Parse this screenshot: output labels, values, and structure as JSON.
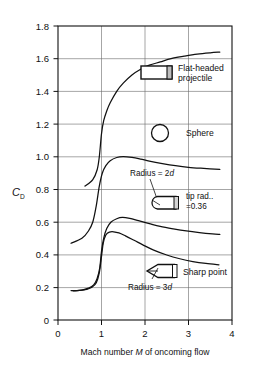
{
  "chart_data": {
    "type": "line",
    "title": "",
    "subtitle": "",
    "xlabel": "Mach number M of oncoming flow",
    "ylabel": "C_D",
    "ylabel_main": "C",
    "ylabel_sub": "D",
    "xlim": [
      0,
      4
    ],
    "ylim": [
      0,
      1.8
    ],
    "grid": true,
    "xticks": [
      "0",
      "1",
      "2",
      "3",
      "4"
    ],
    "xtick_values": [
      0,
      1,
      2,
      3,
      4
    ],
    "yticks": [
      "0",
      "0.2",
      "0.4",
      "0.6",
      "0.8",
      "1.0",
      "1.2",
      "1.4",
      "1.6",
      "1.8"
    ],
    "ytick_values": [
      0,
      0.2,
      0.4,
      0.6,
      0.8,
      1.0,
      1.2,
      1.4,
      1.6,
      1.8
    ],
    "legend_position": "inside-right",
    "series": [
      {
        "name": "Flat-headed projectile",
        "x": [
          0.62,
          0.8,
          0.9,
          0.95,
          1.0,
          1.05,
          1.12,
          1.2,
          1.35,
          1.5,
          1.7,
          1.9,
          2.1,
          2.35,
          2.6,
          2.9,
          3.2,
          3.5,
          3.72
        ],
        "y": [
          0.82,
          0.86,
          0.92,
          1.0,
          1.14,
          1.22,
          1.28,
          1.33,
          1.4,
          1.45,
          1.5,
          1.535,
          1.56,
          1.58,
          1.6,
          1.615,
          1.628,
          1.636,
          1.64
        ]
      },
      {
        "name": "Sphere",
        "x": [
          0.3,
          0.55,
          0.7,
          0.8,
          0.88,
          0.95,
          1.02,
          1.1,
          1.2,
          1.35,
          1.5,
          1.7,
          1.9,
          2.1,
          2.4,
          2.7,
          3.0,
          3.35,
          3.72
        ],
        "y": [
          0.47,
          0.5,
          0.545,
          0.6,
          0.7,
          0.82,
          0.9,
          0.945,
          0.975,
          0.995,
          1.0,
          0.995,
          0.985,
          0.973,
          0.958,
          0.945,
          0.935,
          0.928,
          0.922
        ]
      },
      {
        "name": "Radius = 2d",
        "x": [
          0.35,
          0.55,
          0.7,
          0.82,
          0.9,
          0.96,
          1.0,
          1.05,
          1.12,
          1.22,
          1.35,
          1.48,
          1.65,
          1.85,
          2.1,
          2.35,
          2.65,
          2.95,
          3.25,
          3.55,
          3.72
        ],
        "y": [
          0.178,
          0.183,
          0.195,
          0.215,
          0.255,
          0.32,
          0.42,
          0.5,
          0.56,
          0.6,
          0.62,
          0.628,
          0.622,
          0.608,
          0.59,
          0.573,
          0.558,
          0.545,
          0.535,
          0.527,
          0.524
        ]
      },
      {
        "name": "Radius = 3d",
        "x": [
          0.3,
          0.5,
          0.66,
          0.78,
          0.88,
          0.95,
          1.0,
          1.04,
          1.1,
          1.18,
          1.28,
          1.4,
          1.55,
          1.75,
          1.95,
          2.2,
          2.5,
          2.8,
          3.1,
          3.4,
          3.7
        ],
        "y": [
          0.18,
          0.182,
          0.188,
          0.2,
          0.228,
          0.29,
          0.39,
          0.47,
          0.52,
          0.538,
          0.54,
          0.533,
          0.515,
          0.488,
          0.46,
          0.428,
          0.398,
          0.375,
          0.358,
          0.346,
          0.338
        ]
      }
    ],
    "annotations": [
      {
        "id": "flat-headed",
        "text_line1": "Flat-headed",
        "text_line2": "projectile",
        "icon": "flat-nose-projectile-icon"
      },
      {
        "id": "sphere",
        "text": "Sphere",
        "icon": "sphere-icon"
      },
      {
        "id": "radius-2d",
        "text_prefix": "Radius = 2",
        "text_italic": "d"
      },
      {
        "id": "tip-radius",
        "text_line1": "tip rad..",
        "text_line2_prefix": "=0.36",
        "text_line2_italic": "d",
        "icon": "round-nose-projectile-icon"
      },
      {
        "id": "sharp-point",
        "text": "Sharp point",
        "icon": "sharp-nose-projectile-icon"
      },
      {
        "id": "radius-3d",
        "text_prefix": "Radius = 3",
        "text_italic": "d"
      }
    ],
    "xcaption_prefix": "Mach number ",
    "xcaption_italic": "M",
    "xcaption_suffix": " of oncoming flow",
    "colors": {
      "axis": "#111111",
      "grid": "#555555",
      "curve": "#111111",
      "background": "#ffffff"
    }
  }
}
